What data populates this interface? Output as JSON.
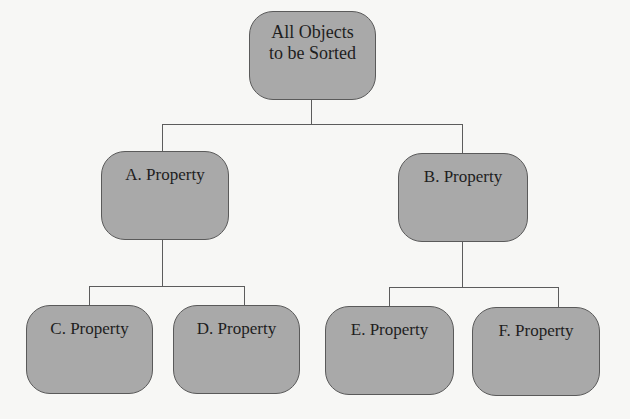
{
  "diagram": {
    "type": "tree",
    "colors": {
      "node_fill": "#a9a9a9",
      "node_border": "#5a5a5a",
      "connector": "#5c5c5c",
      "text": "#1e1e1e",
      "background": "#f7f7f5"
    },
    "root": {
      "label": "All Objects\nto be Sorted"
    },
    "level1": [
      {
        "id": "A",
        "label": "A. Property"
      },
      {
        "id": "B",
        "label": "B. Property"
      }
    ],
    "level2": [
      {
        "id": "C",
        "parent": "A",
        "label": "C. Property"
      },
      {
        "id": "D",
        "parent": "A",
        "label": "D. Property"
      },
      {
        "id": "E",
        "parent": "B",
        "label": "E. Property"
      },
      {
        "id": "F",
        "parent": "B",
        "label": "F. Property"
      }
    ]
  }
}
